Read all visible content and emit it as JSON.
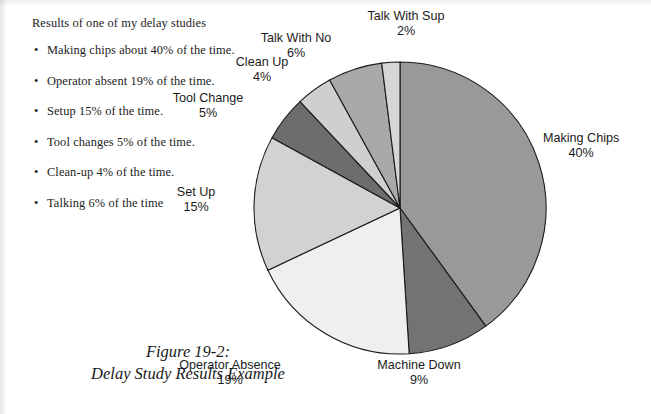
{
  "document": {
    "intro": "Results of one of my delay studies",
    "bullets": [
      "Making chips about 40% of the time.",
      "Operator absent 19% of the time.",
      "Setup 15% of the time.",
      "Tool changes 5% of the time.",
      "Clean-up 4% of the time.",
      "Talking 6% of the time"
    ],
    "bullet_glyph": "•",
    "caption_line1": "Figure 19-2:",
    "caption_line2": "Delay Study Results Example"
  },
  "chart_data": {
    "type": "pie",
    "title": "Delay Study Results Example",
    "subtitle": "Figure 19-2:",
    "units": "percent",
    "start_angle_deg": 0,
    "direction": "clockwise",
    "legend": "none (direct labels)",
    "grid": false,
    "total": 100,
    "categories": [
      "Making Chips",
      "Machine Down",
      "Operator Absence",
      "Set Up",
      "Tool Change",
      "Clean Up",
      "Talk With No",
      "Talk With Sup"
    ],
    "values": [
      40,
      9,
      19,
      15,
      5,
      4,
      6,
      2
    ],
    "labels": [
      "Making Chips",
      "Machine Down",
      "Operator Absence",
      "Set Up",
      "Tool Change",
      "Clean Up",
      "Talk With No",
      "Talk With Sup"
    ],
    "value_labels": [
      "40%",
      "9%",
      "19%",
      "15%",
      "5%",
      "4%",
      "6%",
      "2%"
    ],
    "colors": [
      "#999999",
      "#737373",
      "#efefef",
      "#d2d2d2",
      "#6d6d6d",
      "#cfcfcf",
      "#a9a9a9",
      "#d6d6d6"
    ],
    "slice_outline_color": "#1a1a1a",
    "background_color": "#ffffff",
    "text_color": "#1b1b1b",
    "slices": [
      {
        "name": "Making Chips",
        "percent": 40,
        "value_label": "40%",
        "color": "#999999"
      },
      {
        "name": "Machine Down",
        "percent": 9,
        "value_label": "9%",
        "color": "#737373"
      },
      {
        "name": "Operator Absence",
        "percent": 19,
        "value_label": "19%",
        "color": "#efefef"
      },
      {
        "name": "Set Up",
        "percent": 15,
        "value_label": "15%",
        "color": "#d2d2d2"
      },
      {
        "name": "Tool Change",
        "percent": 5,
        "value_label": "5%",
        "color": "#6d6d6d"
      },
      {
        "name": "Clean Up",
        "percent": 4,
        "value_label": "4%",
        "color": "#cfcfcf"
      },
      {
        "name": "Talk With No",
        "percent": 6,
        "value_label": "6%",
        "color": "#a9a9a9"
      },
      {
        "name": "Talk With Sup",
        "percent": 2,
        "value_label": "2%",
        "color": "#d6d6d6"
      }
    ],
    "geometry": {
      "cx": 400,
      "cy": 208,
      "r": 146
    },
    "label_positions": [
      {
        "name": "Making Chips",
        "x": 545,
        "y": 138,
        "align": "left"
      },
      {
        "name": "Machine Down",
        "x": 419,
        "y": 363,
        "align": "center"
      },
      {
        "name": "Operator Absence",
        "x": 229,
        "y": 363,
        "align": "center"
      },
      {
        "name": "Set Up",
        "x": 196,
        "y": 192,
        "align": "center"
      },
      {
        "name": "Tool Change",
        "x": 208,
        "y": 98,
        "align": "center"
      },
      {
        "name": "Clean Up",
        "x": 262,
        "y": 62,
        "align": "center"
      },
      {
        "name": "Talk With No",
        "x": 296,
        "y": 38,
        "align": "center"
      },
      {
        "name": "Talk With Sup",
        "x": 357,
        "y": 14,
        "align": "center"
      }
    ]
  }
}
